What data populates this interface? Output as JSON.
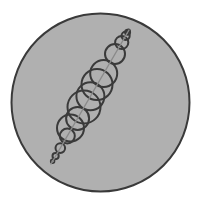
{
  "figure": {
    "name": "pappus-circle-chain",
    "canvas": {
      "width": 201,
      "height": 206,
      "background": "#ffffff"
    },
    "outer_circle": {
      "label": "outer-circle",
      "cx": 100.5,
      "cy": 102.5,
      "r": 89.0,
      "fill": "#b0b0b0",
      "stroke": "#3a3a3a",
      "stroke_width": 2.0
    },
    "axis_line": {
      "label": "chain-axis-line",
      "x1": 51.0,
      "y1": 164.0,
      "x2": 129.0,
      "y2": 30.0,
      "stroke": "#8a8a8a",
      "stroke_width": 1.4
    },
    "chain": {
      "label": "tangent-circle-chain",
      "stroke": "#3a3a3a",
      "stroke_width": 2.0,
      "fill": "none",
      "count": 15,
      "circles": [
        {
          "cx": 52.6,
          "cy": 161.3,
          "r": 1.9
        },
        {
          "cx": 55.6,
          "cy": 156.1,
          "r": 3.1
        },
        {
          "cx": 60.3,
          "cy": 148.1,
          "r": 4.8
        },
        {
          "cx": 67.3,
          "cy": 136.0,
          "r": 7.5
        },
        {
          "cx": 77.6,
          "cy": 118.4,
          "r": 11.5
        },
        {
          "cx": 90.4,
          "cy": 96.3,
          "r": 14.0
        },
        {
          "cx": 103.7,
          "cy": 73.5,
          "r": 13.5
        },
        {
          "cx": 115.0,
          "cy": 54.0,
          "r": 10.0
        },
        {
          "cx": 121.7,
          "cy": 42.5,
          "r": 6.6
        },
        {
          "cx": 125.6,
          "cy": 35.8,
          "r": 4.1
        },
        {
          "cx": 127.6,
          "cy": 32.3,
          "r": 2.5
        },
        {
          "cx": 128.7,
          "cy": 30.5,
          "r": 1.4
        },
        {
          "cx": 84.0,
          "cy": 107.0,
          "r": 16.5
        },
        {
          "cx": 97.0,
          "cy": 84.5,
          "r": 15.5
        },
        {
          "cx": 70.5,
          "cy": 128.0,
          "r": 13.5
        }
      ]
    }
  }
}
